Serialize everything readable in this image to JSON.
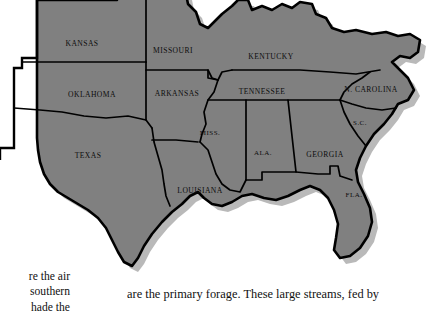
{
  "figure": {
    "kind": "map",
    "region_name": "Southern United States",
    "style": {
      "land_fill": "#808080",
      "outline": "#000000",
      "shadow": "#b9b9b9",
      "background": "#ffffff",
      "label_color": "#0d0d0d"
    },
    "states": [
      {
        "id": "kansas",
        "label": "KANSAS",
        "x": 82,
        "y": 44
      },
      {
        "id": "missouri",
        "label": "MISSOURI",
        "x": 173,
        "y": 51
      },
      {
        "id": "kentucky",
        "label": "KENTUCKY",
        "x": 271,
        "y": 57
      },
      {
        "id": "oklahoma",
        "label": "OKLAHOMA",
        "x": 92,
        "y": 95
      },
      {
        "id": "arkansas",
        "label": "ARKANSAS",
        "x": 177,
        "y": 94
      },
      {
        "id": "tennessee",
        "label": "TENNESSEE",
        "x": 262,
        "y": 92
      },
      {
        "id": "north-carolina",
        "label": "N. CAROLINA",
        "x": 371,
        "y": 90
      },
      {
        "id": "mississippi",
        "label": "MISS.",
        "x": 210,
        "y": 133
      },
      {
        "id": "south-carolina",
        "label": "S.C.",
        "x": 360,
        "y": 123
      },
      {
        "id": "texas",
        "label": "TEXAS",
        "x": 88,
        "y": 156
      },
      {
        "id": "alabama",
        "label": "ALA.",
        "x": 263,
        "y": 153
      },
      {
        "id": "georgia",
        "label": "GEORGIA",
        "x": 325,
        "y": 155
      },
      {
        "id": "louisiana",
        "label": "LOUISIANA",
        "x": 200,
        "y": 191
      },
      {
        "id": "florida",
        "label": "FLA.",
        "x": 354,
        "y": 195
      }
    ]
  },
  "text": {
    "left_column": [
      "re the air",
      "southern",
      "hade  the"
    ],
    "right_column": [
      "are the primary forage. These large streams, fed by"
    ]
  }
}
